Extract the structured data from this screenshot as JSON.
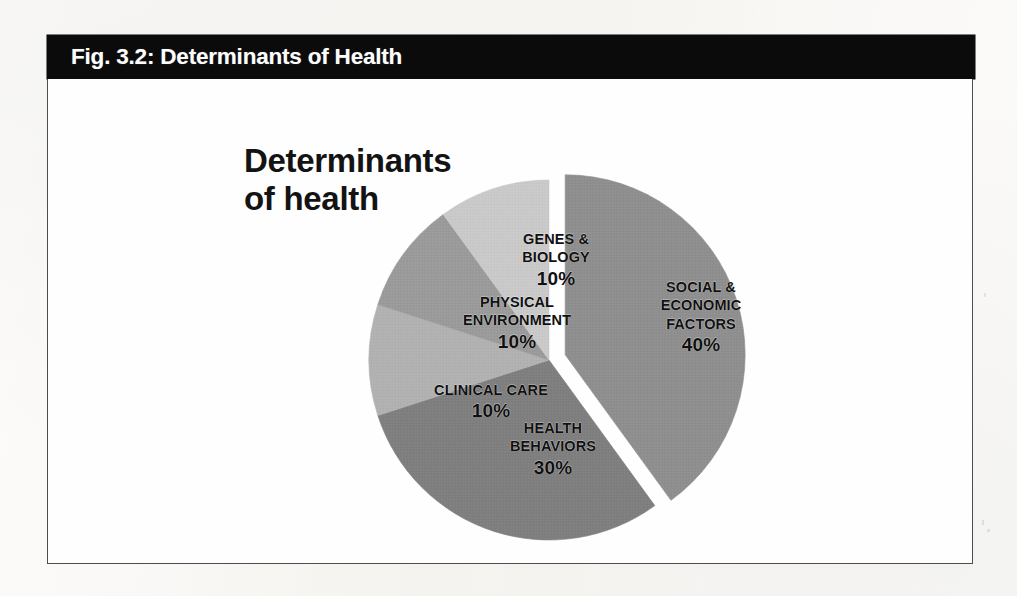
{
  "figure": {
    "header_label": "Fig. 3.2: Determinants of Health",
    "chart_title_line1": "Determinants",
    "chart_title_line2": "of health"
  },
  "colors": {
    "header_background": "#0b0b0b",
    "header_text": "#fdfdfd",
    "page_background": "#f8f7f4",
    "chart_background": "#fefefe",
    "frame_border": "#4d4d4d",
    "label_text": "#101010",
    "slice_social": "#8e8e8e",
    "slice_health": "#7e7e7e",
    "slice_clinical": "#b1b1b1",
    "slice_physical": "#9a9a9a",
    "slice_genes": "#c9c9c9"
  },
  "chart_data": {
    "type": "pie",
    "title": "Determinants of health",
    "xlabel": "",
    "ylabel": "",
    "legend_position": "none",
    "grid": false,
    "labels_on_slices": true,
    "exploded_slice": "SOCIAL & ECONOMIC FACTORS",
    "categories": [
      "SOCIAL & ECONOMIC FACTORS",
      "HEALTH BEHAVIORS",
      "CLINICAL CARE",
      "PHYSICAL ENVIRONMENT",
      "GENES & BIOLOGY"
    ],
    "values": [
      40,
      30,
      10,
      10,
      10
    ],
    "value_labels": [
      "40%",
      "30%",
      "10%",
      "10%",
      "10%"
    ],
    "slices": [
      {
        "name": "SOCIAL & ECONOMIC FACTORS",
        "name_lines": [
          "SOCIAL &",
          "ECONOMIC",
          "FACTORS"
        ],
        "value": 40,
        "value_label": "40%",
        "color": "#8e8e8e",
        "exploded": true
      },
      {
        "name": "HEALTH BEHAVIORS",
        "name_lines": [
          "HEALTH",
          "BEHAVIORS"
        ],
        "value": 30,
        "value_label": "30%",
        "color": "#7e7e7e",
        "exploded": false
      },
      {
        "name": "CLINICAL CARE",
        "name_lines": [
          "CLINICAL CARE"
        ],
        "value": 10,
        "value_label": "10%",
        "color": "#b1b1b1",
        "exploded": false
      },
      {
        "name": "PHYSICAL ENVIRONMENT",
        "name_lines": [
          "PHYSICAL",
          "ENVIRONMENT"
        ],
        "value": 10,
        "value_label": "10%",
        "color": "#9a9a9a",
        "exploded": false
      },
      {
        "name": "GENES & BIOLOGY",
        "name_lines": [
          "GENES &",
          "BIOLOGY"
        ],
        "value": 10,
        "value_label": "10%",
        "color": "#c9c9c9",
        "exploded": false
      }
    ],
    "total": 100,
    "units": "percent"
  }
}
